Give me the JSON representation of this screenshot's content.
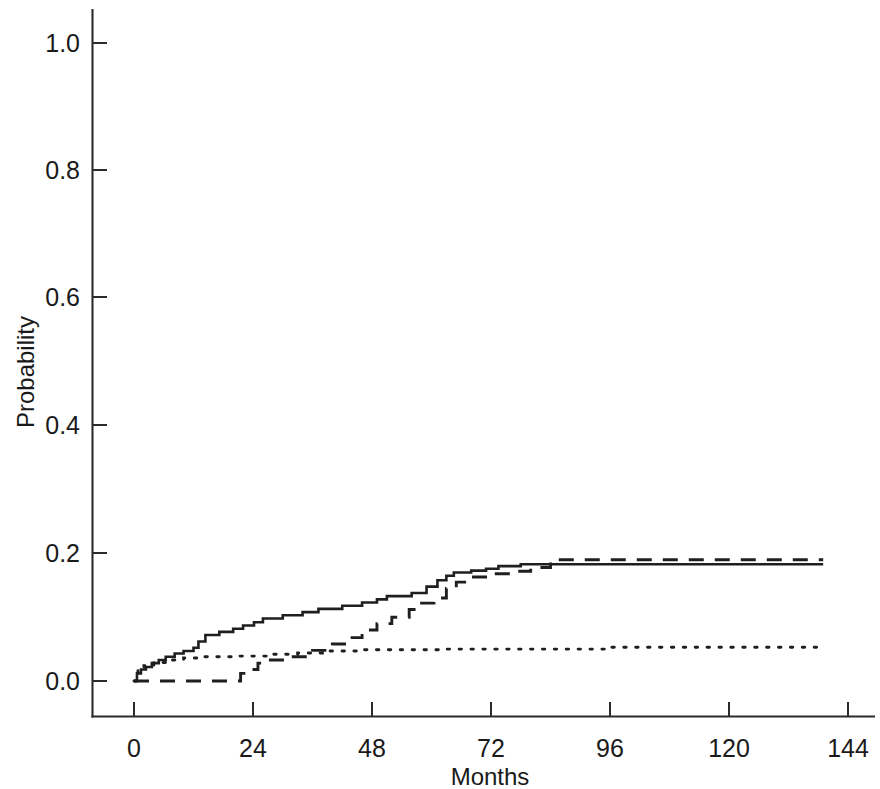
{
  "chart_data": {
    "type": "line",
    "title": "",
    "subtitle": "",
    "xlabel": "Months",
    "ylabel": "Probability",
    "xlim": [
      -4,
      150
    ],
    "ylim": [
      -0.035,
      1.05
    ],
    "x_ticks": [
      0,
      24,
      48,
      72,
      96,
      120,
      144
    ],
    "x_tick_labels": [
      "0",
      "24",
      "48",
      "72",
      "96",
      "120",
      "144"
    ],
    "y_ticks": [
      0.0,
      0.2,
      0.4,
      0.6,
      0.8,
      1.0
    ],
    "y_tick_labels": [
      "0.0",
      "0.2",
      "0.4",
      "0.6",
      "0.8",
      "1.0"
    ],
    "grid": false,
    "legend": false,
    "legend_position": "none",
    "step_style": "post",
    "annotations": [],
    "series": [
      {
        "name": "curve-solid",
        "style": "solid",
        "color": "#1f1f1f",
        "points": [
          [
            0.0,
            0.0
          ],
          [
            0.6,
            0.012
          ],
          [
            1.4,
            0.018
          ],
          [
            2.4,
            0.022
          ],
          [
            3.6,
            0.028
          ],
          [
            5.0,
            0.033
          ],
          [
            6.4,
            0.038
          ],
          [
            8.2,
            0.043
          ],
          [
            10.0,
            0.047
          ],
          [
            12.0,
            0.052
          ],
          [
            13.0,
            0.062
          ],
          [
            14.4,
            0.072
          ],
          [
            17.2,
            0.077
          ],
          [
            20.0,
            0.082
          ],
          [
            22.0,
            0.087
          ],
          [
            24.2,
            0.092
          ],
          [
            26.0,
            0.098
          ],
          [
            30.0,
            0.103
          ],
          [
            34.0,
            0.108
          ],
          [
            37.2,
            0.113
          ],
          [
            42.0,
            0.118
          ],
          [
            46.0,
            0.123
          ],
          [
            49.0,
            0.128
          ],
          [
            51.0,
            0.133
          ],
          [
            56.0,
            0.138
          ],
          [
            59.0,
            0.148
          ],
          [
            61.2,
            0.158
          ],
          [
            63.0,
            0.165
          ],
          [
            64.5,
            0.17
          ],
          [
            68.0,
            0.173
          ],
          [
            71.0,
            0.176
          ],
          [
            73.5,
            0.18
          ],
          [
            78.0,
            0.183
          ],
          [
            139.0,
            0.183
          ]
        ]
      },
      {
        "name": "curve-dashed",
        "style": "dashed",
        "color": "#1f1f1f",
        "points": [
          [
            0.0,
            0.0
          ],
          [
            20.5,
            0.0
          ],
          [
            21.5,
            0.012
          ],
          [
            23.0,
            0.018
          ],
          [
            25.0,
            0.028
          ],
          [
            27.0,
            0.033
          ],
          [
            31.0,
            0.038
          ],
          [
            36.0,
            0.048
          ],
          [
            40.0,
            0.058
          ],
          [
            43.0,
            0.068
          ],
          [
            46.0,
            0.08
          ],
          [
            49.0,
            0.09
          ],
          [
            52.0,
            0.1
          ],
          [
            55.5,
            0.112
          ],
          [
            58.0,
            0.122
          ],
          [
            60.5,
            0.13
          ],
          [
            63.0,
            0.145
          ],
          [
            65.0,
            0.155
          ],
          [
            68.0,
            0.163
          ],
          [
            71.5,
            0.168
          ],
          [
            76.0,
            0.172
          ],
          [
            80.0,
            0.178
          ],
          [
            84.0,
            0.19
          ],
          [
            139.0,
            0.19
          ]
        ]
      },
      {
        "name": "curve-dotted",
        "style": "dotted",
        "color": "#1f1f1f",
        "points": [
          [
            0.0,
            0.0
          ],
          [
            0.8,
            0.018
          ],
          [
            2.0,
            0.024
          ],
          [
            4.0,
            0.029
          ],
          [
            7.0,
            0.033
          ],
          [
            10.0,
            0.036
          ],
          [
            14.0,
            0.038
          ],
          [
            21.0,
            0.039
          ],
          [
            28.0,
            0.042
          ],
          [
            33.0,
            0.044
          ],
          [
            38.0,
            0.047
          ],
          [
            46.0,
            0.049
          ],
          [
            62.0,
            0.05
          ],
          [
            96.0,
            0.053
          ],
          [
            139.0,
            0.054
          ]
        ]
      }
    ]
  },
  "axes": {
    "y_axis_title": "Probability",
    "x_axis_title": "Months"
  }
}
